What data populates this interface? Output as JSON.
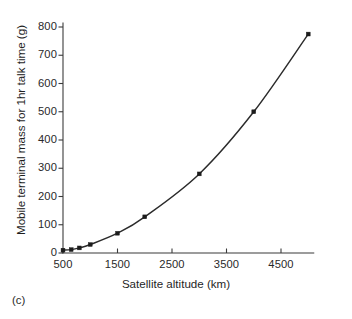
{
  "caption": "(c)",
  "chart_data": {
    "type": "line",
    "title": "",
    "subtitle": "",
    "xlabel": "Satellite altitude (km)",
    "ylabel": "Mobile terminal mass for 1hr talk time (g)",
    "xlim": [
      400,
      5100
    ],
    "ylim": [
      0,
      800
    ],
    "xticks": [
      500,
      1500,
      2500,
      3500,
      4500
    ],
    "xtick_labels": [
      "500",
      "1500",
      "2500",
      "3500",
      "4500"
    ],
    "yticks": [
      0,
      100,
      200,
      300,
      400,
      500,
      600,
      700,
      800
    ],
    "ytick_labels": [
      "0",
      "100",
      "200",
      "300",
      "400",
      "500",
      "600",
      "700",
      "800"
    ],
    "grid": false,
    "legend": false,
    "legend_position": "none",
    "marker": "square",
    "series": [
      {
        "name": "Mobile terminal mass",
        "x": [
          500,
          650,
          800,
          1000,
          1500,
          2000,
          3000,
          4000,
          5000
        ],
        "values": [
          10,
          12,
          18,
          30,
          70,
          128,
          280,
          500,
          775
        ]
      }
    ]
  }
}
